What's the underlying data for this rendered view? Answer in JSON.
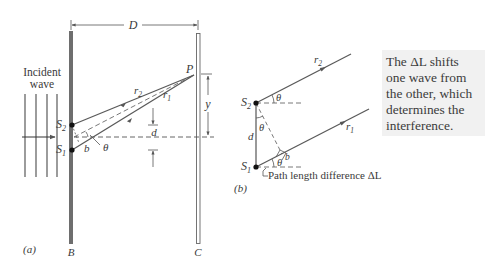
{
  "figure": {
    "panel_a": {
      "label": "(a)",
      "incident_label_line1": "Incident",
      "incident_label_line2": "wave",
      "barrier_label": "B",
      "screen_label": "C",
      "distance_label": "D",
      "point_label": "P",
      "height_label": "y",
      "separation_label": "d",
      "source_upper": {
        "base": "S",
        "sub": "2"
      },
      "source_lower": {
        "base": "S",
        "sub": "1"
      },
      "ray_upper": {
        "base": "r",
        "sub": "2"
      },
      "ray_lower": {
        "base": "r",
        "sub": "1"
      },
      "segment_label": "b",
      "angle_label": "θ"
    },
    "panel_b": {
      "label": "(b)",
      "source_upper": {
        "base": "S",
        "sub": "2"
      },
      "source_lower": {
        "base": "S",
        "sub": "1"
      },
      "ray_upper": {
        "base": "r",
        "sub": "2"
      },
      "ray_lower": {
        "base": "r",
        "sub": "1"
      },
      "separation_label": "d",
      "segment_label": "b",
      "angle_label": "θ",
      "path_difference_label": "Path length difference ΔL"
    },
    "callout": {
      "lines": [
        "The ΔL shifts",
        "one wave from",
        "the other, which",
        "determines the",
        "interference."
      ]
    },
    "colors": {
      "line": "#555555",
      "barrier": "#6e6e6e",
      "callout_bg": "#f1f1f1",
      "text": "#3a3a3a"
    }
  }
}
